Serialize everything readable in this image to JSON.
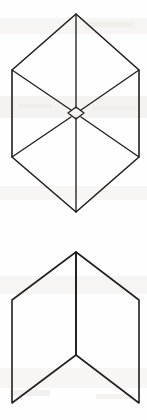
{
  "sheet": {
    "title": "Geometric Line Figures",
    "width": 147,
    "height": 420,
    "background_color": "#fefefe",
    "ink_color": "#231f20",
    "description": "Scanned black-and-white line drawing containing two outlined geometric figures stacked vertically, no text labels present."
  },
  "figures": [
    {
      "id": "hexagon-cube",
      "name": "isometric-hexagon-with-internal-diagonals",
      "description": "Upper figure: a regular hexagon drawn in isometric projection resembling a cube seen corner-on, with a vertical center line and four internal diagonals converging on a small diamond at the center.",
      "bounds": {
        "x": 12,
        "y": 14,
        "width": 127,
        "height": 198
      },
      "vertices": {
        "top": [
          76,
          14
        ],
        "upper_left": [
          12,
          70
        ],
        "upper_right": [
          139,
          70
        ],
        "lower_left": [
          12,
          157
        ],
        "lower_right": [
          139,
          157
        ],
        "bottom": [
          76,
          212
        ],
        "center": [
          76,
          113
        ]
      },
      "outline_points": "76,14 139,70 139,157 76,212 12,157 12,70",
      "center_vertical_top": "76,14 76,108",
      "center_vertical_bottom": "76,118 76,212",
      "diagonal_upper_left": "12,70 71,110",
      "diagonal_upper_right": "139,70 81,110",
      "diagonal_lower_left": "12,157 71,117",
      "diagonal_lower_right": "139,157 81,117",
      "center_diamond_points": "76,107 84,113 76,119 68,113"
    },
    {
      "id": "chevron",
      "name": "open-book-chevron-figure",
      "description": "Lower figure: an open chevron or folded-panel shape formed by two quadrilateral panels meeting at a vertical crease, apex pointing up and the lower edges forming a downward V.",
      "bounds": {
        "x": 12,
        "y": 252,
        "width": 127,
        "height": 151
      },
      "vertices": {
        "apex": [
          76,
          252
        ],
        "left_outer_top": [
          12,
          300
        ],
        "right_outer_top": [
          139,
          300
        ],
        "left_outer_bottom": [
          12,
          403
        ],
        "right_outer_bottom": [
          139,
          403
        ],
        "crease_bottom": [
          76,
          355
        ]
      },
      "left_panel_points": "76,252 12,300 12,403 76,355",
      "right_panel_points": "76,252 139,300 139,403 76,355",
      "crease_line": "76,252 76,355"
    }
  ]
}
